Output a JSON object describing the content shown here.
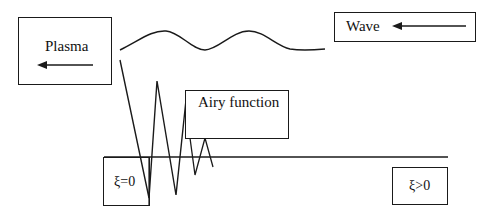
{
  "diagram": {
    "colors": {
      "stroke": "#1a1a1a",
      "text": "#111111",
      "background": "#ffffff"
    },
    "plasma_box": {
      "label": "Plasma",
      "arrow_direction": "left",
      "arrow_icon": "left-arrow-icon"
    },
    "wave_box": {
      "label": "Wave",
      "arrow_direction": "left",
      "arrow_icon": "left-arrow-icon"
    },
    "airy_box": {
      "label": "Airy function"
    },
    "xi_zero_box": {
      "label": "ξ=0"
    },
    "xi_positive_box": {
      "label": "ξ>0"
    },
    "incident_wave": {
      "description": "sinusoidal wave curve",
      "icon": "wave-curve"
    },
    "airy_curve": {
      "description": "decaying oscillating zigzag (Airy function)"
    },
    "boundary_line": {
      "description": "horizontal boundary line at ξ=0"
    }
  }
}
